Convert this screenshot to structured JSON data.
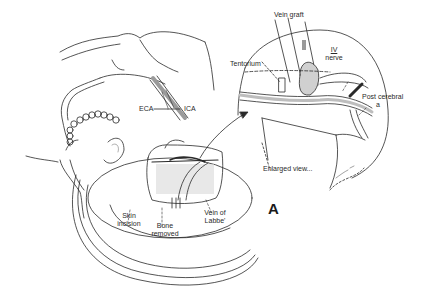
{
  "figure": {
    "panel_letter": "A",
    "colors": {
      "ink": "#2a2a2a",
      "shade": "#9a9a9a",
      "paper": "#ffffff"
    }
  },
  "labels": {
    "vein_graft": "Vein graft",
    "tentorium": "Tentorium",
    "iv_nerve_numeral": "IV",
    "iv_nerve_word": "nerve",
    "post_cerebral_line1": "Post cerebral",
    "post_cerebral_line2": "a",
    "eca": "ECA",
    "ica": "ICA",
    "enlarged_view": "Enlarged view...",
    "skin_incision_line1": "Skin",
    "skin_incision_line2": "incision",
    "bone_removed_line1": "Bone",
    "bone_removed_line2": "removed",
    "vein_of_labbe_line1": "Vein of",
    "vein_of_labbe_line2": "Labbe'"
  }
}
